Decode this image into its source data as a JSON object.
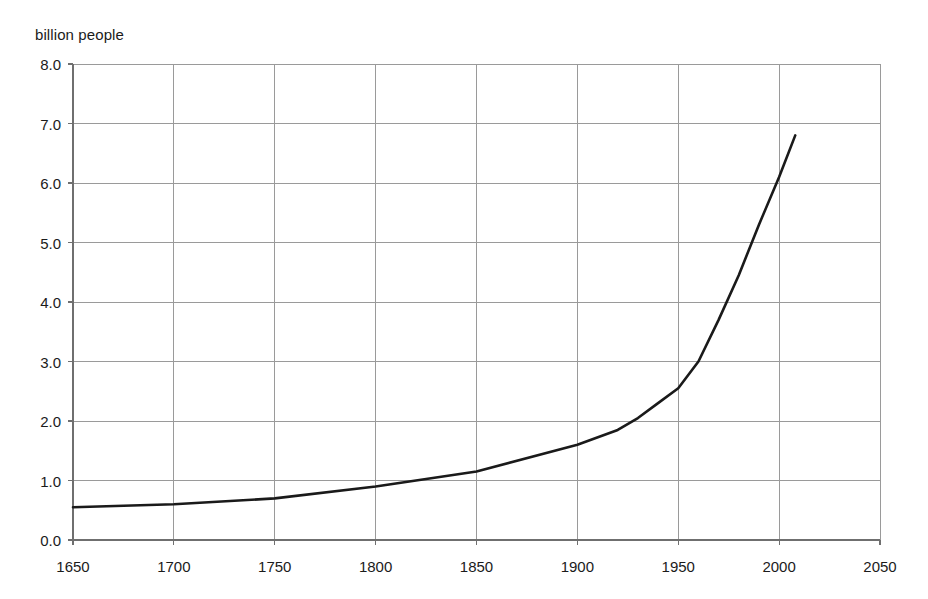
{
  "chart_data": {
    "type": "line",
    "title": "",
    "ylabel": "billion people",
    "xlabel": "",
    "xlim": [
      1650,
      2050
    ],
    "ylim": [
      0.0,
      8.0
    ],
    "xticks": [
      1650,
      1700,
      1750,
      1800,
      1850,
      1900,
      1950,
      2000,
      2050
    ],
    "xtick_labels": [
      "1650",
      "1700",
      "1750",
      "1800",
      "1850",
      "1900",
      "1950",
      "2000",
      "2050"
    ],
    "yticks": [
      0.0,
      1.0,
      2.0,
      3.0,
      4.0,
      5.0,
      6.0,
      7.0,
      8.0
    ],
    "ytick_labels": [
      "0.0",
      "1.0",
      "2.0",
      "3.0",
      "4.0",
      "5.0",
      "6.0",
      "7.0",
      "8.0"
    ],
    "grid": true,
    "legend": false,
    "series": [
      {
        "name": "World population",
        "color": "#1a1a1a",
        "x": [
          1650,
          1700,
          1750,
          1800,
          1850,
          1900,
          1920,
          1930,
          1940,
          1950,
          1960,
          1970,
          1980,
          1990,
          2000,
          2008
        ],
        "values": [
          0.55,
          0.6,
          0.7,
          0.9,
          1.15,
          1.6,
          1.85,
          2.05,
          2.3,
          2.55,
          3.0,
          3.7,
          4.45,
          5.3,
          6.1,
          6.8
        ]
      }
    ],
    "axis_color": "#6f6f6f",
    "grid_color": "#9a9a9a",
    "line_color": "#1a1a1a",
    "background": "#ffffff"
  },
  "geometry": {
    "plot_left": 73,
    "plot_right": 880,
    "plot_top": 64,
    "plot_bottom": 540
  }
}
